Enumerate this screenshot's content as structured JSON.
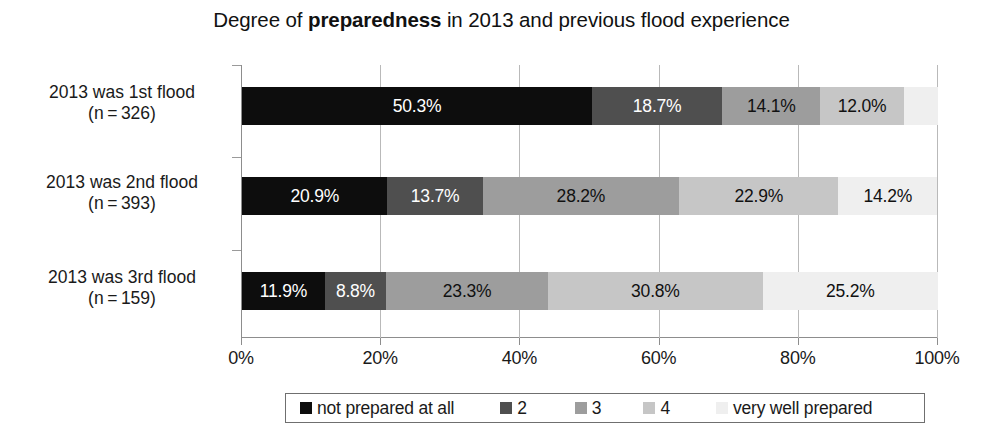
{
  "chart_data": {
    "type": "bar",
    "orientation": "horizontal",
    "stacked": true,
    "normalized": "percent",
    "title_plain": "Degree of preparedness in 2013 and previous flood experience",
    "title_parts": [
      {
        "text": "Degree of ",
        "bold": false
      },
      {
        "text": "preparedness",
        "bold": true
      },
      {
        "text": " in 2013 and previous flood experience",
        "bold": false
      }
    ],
    "xlabel": "",
    "ylabel": "",
    "xlim": [
      0,
      100
    ],
    "xticks": [
      0,
      20,
      40,
      60,
      80,
      100
    ],
    "xtick_labels": [
      "0%",
      "20%",
      "40%",
      "60%",
      "80%",
      "100%"
    ],
    "grid": "vertical",
    "legend_position": "bottom",
    "categories": [
      "2013 was 1st flood (n=326)",
      "2013 was 2nd flood (n=393)",
      "2013 was 3rd flood (n=159)"
    ],
    "category_lines": [
      [
        "2013 was 1st flood",
        "(n = 326)"
      ],
      [
        "2013 was 2nd flood",
        "(n = 393)"
      ],
      [
        "2013 was 3rd flood",
        "(n = 159)"
      ]
    ],
    "series": [
      {
        "name": "not prepared at all",
        "color": "#0d0d0d",
        "text_color": "#ffffff",
        "values": [
          50.3,
          20.9,
          11.9
        ],
        "labels": [
          "50.3%",
          "20.9%",
          "11.9%"
        ]
      },
      {
        "name": "2",
        "color": "#4f4f4f",
        "text_color": "#ffffff",
        "values": [
          18.7,
          13.7,
          8.8
        ],
        "labels": [
          "18.7%",
          "13.7%",
          "8.8%"
        ]
      },
      {
        "name": "3",
        "color": "#9d9d9d",
        "text_color": "#111111",
        "values": [
          14.1,
          28.2,
          23.3
        ],
        "labels": [
          "14.1%",
          "28.2%",
          "23.3%"
        ]
      },
      {
        "name": "4",
        "color": "#c6c6c6",
        "text_color": "#111111",
        "values": [
          12.0,
          22.9,
          30.8
        ],
        "labels": [
          "12.0%",
          "22.9%",
          "30.8%"
        ]
      },
      {
        "name": "very well prepared",
        "color": "#efefef",
        "text_color": "#111111",
        "values": [
          4.9,
          14.2,
          25.2
        ],
        "labels": [
          "",
          "14.2%",
          "25.2%"
        ]
      }
    ]
  },
  "legend": {
    "items": [
      {
        "label": "not prepared at all",
        "color": "#0d0d0d"
      },
      {
        "label": "2",
        "color": "#4f4f4f"
      },
      {
        "label": "3",
        "color": "#9d9d9d"
      },
      {
        "label": "4",
        "color": "#c6c6c6"
      },
      {
        "label": "very well prepared",
        "color": "#efefef"
      }
    ]
  }
}
